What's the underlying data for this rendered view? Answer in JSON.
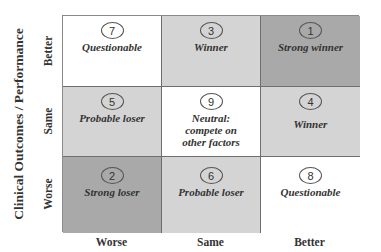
{
  "y_axis": {
    "title": "Clinical Outcomes / Performance",
    "rows": [
      "Better",
      "Same",
      "Worse"
    ]
  },
  "x_axis": {
    "columns": [
      "Worse",
      "Same",
      "Better"
    ]
  },
  "colors": {
    "strong": "#a9a9a9",
    "moderate": "#d4d4d4",
    "neutral": "#ffffff"
  },
  "cells": [
    {
      "row": "Better",
      "col": "Worse",
      "number": "7",
      "label": "Questionable",
      "shade": "white"
    },
    {
      "row": "Better",
      "col": "Same",
      "number": "3",
      "label": "Winner",
      "shade": "light"
    },
    {
      "row": "Better",
      "col": "Better",
      "number": "1",
      "label": "Strong winner",
      "shade": "dark"
    },
    {
      "row": "Same",
      "col": "Worse",
      "number": "5",
      "label": "Probable loser",
      "shade": "light"
    },
    {
      "row": "Same",
      "col": "Same",
      "number": "9",
      "label": "Neutral: compete on other factors",
      "label_lines": [
        "Neutral:",
        "compete on",
        "other factors"
      ],
      "shade": "white"
    },
    {
      "row": "Same",
      "col": "Better",
      "number": "4",
      "label": "Winner",
      "shade": "light"
    },
    {
      "row": "Worse",
      "col": "Worse",
      "number": "2",
      "label": "Strong loser",
      "shade": "dark"
    },
    {
      "row": "Worse",
      "col": "Same",
      "number": "6",
      "label": "Probable loser",
      "shade": "light"
    },
    {
      "row": "Worse",
      "col": "Better",
      "number": "8",
      "label": "Questionable",
      "shade": "white"
    }
  ]
}
